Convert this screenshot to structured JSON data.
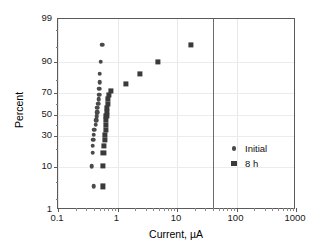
{
  "chart_data": {
    "type": "scatter",
    "title": "",
    "xlabel": "Current, µA",
    "ylabel": "Percent",
    "xscale": "log",
    "yscale": "probability",
    "xlim": [
      0.1,
      1000
    ],
    "ylim": [
      1,
      99
    ],
    "xticks": [
      0.1,
      1,
      10,
      100,
      1000
    ],
    "xtick_labels": [
      "0.1",
      "1",
      "10",
      "100",
      "1000"
    ],
    "yticks": [
      1,
      10,
      30,
      50,
      70,
      90,
      99
    ],
    "ytick_labels": [
      "1",
      "10",
      "30",
      "50",
      "70",
      "90",
      "99"
    ],
    "grid": true,
    "legend_position": "right-center",
    "annotations": [
      {
        "type": "vline",
        "x": 40,
        "label": ""
      }
    ],
    "series": [
      {
        "name": "Initial",
        "marker": "circle",
        "color": "#4a4a4a",
        "points": [
          {
            "x": 0.4,
            "y": 4.0
          },
          {
            "x": 0.37,
            "y": 10.5
          },
          {
            "x": 0.38,
            "y": 17.5
          },
          {
            "x": 0.38,
            "y": 22.5
          },
          {
            "x": 0.39,
            "y": 27.0
          },
          {
            "x": 0.4,
            "y": 31.0
          },
          {
            "x": 0.41,
            "y": 35.5
          },
          {
            "x": 0.43,
            "y": 40.0
          },
          {
            "x": 0.44,
            "y": 44.5
          },
          {
            "x": 0.45,
            "y": 48.5
          },
          {
            "x": 0.46,
            "y": 52.5
          },
          {
            "x": 0.46,
            "y": 56.5
          },
          {
            "x": 0.47,
            "y": 60.5
          },
          {
            "x": 0.48,
            "y": 64.5
          },
          {
            "x": 0.49,
            "y": 68.5
          },
          {
            "x": 0.49,
            "y": 73.5
          },
          {
            "x": 0.5,
            "y": 78.5
          },
          {
            "x": 0.5,
            "y": 84.0
          },
          {
            "x": 0.52,
            "y": 90.0
          },
          {
            "x": 0.55,
            "y": 95.5
          }
        ]
      },
      {
        "name": "8 h",
        "marker": "square",
        "color": "#3a3a3a",
        "points": [
          {
            "x": 0.56,
            "y": 4.0
          },
          {
            "x": 0.56,
            "y": 10.5
          },
          {
            "x": 0.58,
            "y": 17.5
          },
          {
            "x": 0.6,
            "y": 22.5
          },
          {
            "x": 0.61,
            "y": 27.0
          },
          {
            "x": 0.62,
            "y": 31.0
          },
          {
            "x": 0.63,
            "y": 35.5
          },
          {
            "x": 0.64,
            "y": 40.0
          },
          {
            "x": 0.64,
            "y": 44.5
          },
          {
            "x": 0.65,
            "y": 48.5
          },
          {
            "x": 0.66,
            "y": 52.5
          },
          {
            "x": 0.67,
            "y": 56.5
          },
          {
            "x": 0.68,
            "y": 60.5
          },
          {
            "x": 0.69,
            "y": 64.5
          },
          {
            "x": 0.72,
            "y": 68.5
          },
          {
            "x": 0.78,
            "y": 71.5
          },
          {
            "x": 1.4,
            "y": 77.0
          },
          {
            "x": 2.4,
            "y": 84.0
          },
          {
            "x": 4.8,
            "y": 90.0
          },
          {
            "x": 17.0,
            "y": 95.5
          }
        ]
      }
    ]
  },
  "legend": {
    "entries": [
      {
        "label": "Initial",
        "marker": "circle-marker-icon"
      },
      {
        "label": "8 h",
        "marker": "square-marker-icon"
      }
    ]
  }
}
